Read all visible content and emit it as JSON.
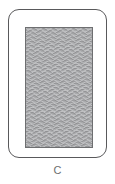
{
  "figure": {
    "caption": "C",
    "frame": {
      "name": "rounded-device-outline",
      "fill_color": "#ffffff",
      "border_color": "#59595b",
      "corner_radius_px": 11
    },
    "panel": {
      "name": "wavy-texture-panel",
      "base_color": "#a9aaac",
      "border_color": "#6e6f71",
      "line_color": "#8c8d8f",
      "highlight_color": "#c3c4c6",
      "pattern": "horizontal-wavy-lines",
      "wave_rows": 58,
      "wave_row_spacing_px": 2.1,
      "wave_wavelength_px": 10,
      "wave_amplitude_px": 1.1
    }
  }
}
